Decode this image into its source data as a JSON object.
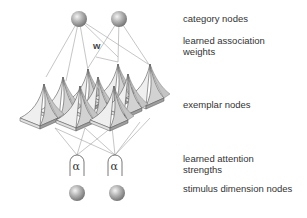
{
  "diagram": {
    "labels": {
      "category_nodes": "category nodes",
      "association_weights": "learned association weights",
      "exemplar_nodes": "exemplar nodes",
      "attention_strengths": "learned attention strengths",
      "stimulus_nodes": "stimulus dimension nodes"
    },
    "weight_symbol": "w",
    "attention_symbol": "α",
    "category_nodes": [
      {
        "x": 79,
        "y": 19
      },
      {
        "x": 119,
        "y": 19
      }
    ],
    "stimulus_nodes": [
      {
        "x": 77,
        "y": 193
      },
      {
        "x": 117,
        "y": 193
      }
    ],
    "attention_gates": [
      {
        "x": 77,
        "y": 165
      },
      {
        "x": 115,
        "y": 165
      }
    ],
    "colors": {
      "line": "#9a9a9a",
      "pyramid_light": "#eeeeee",
      "pyramid_mid": "#cfcfcf",
      "pyramid_dark": "#9c9c9c",
      "text": "#333333"
    }
  }
}
